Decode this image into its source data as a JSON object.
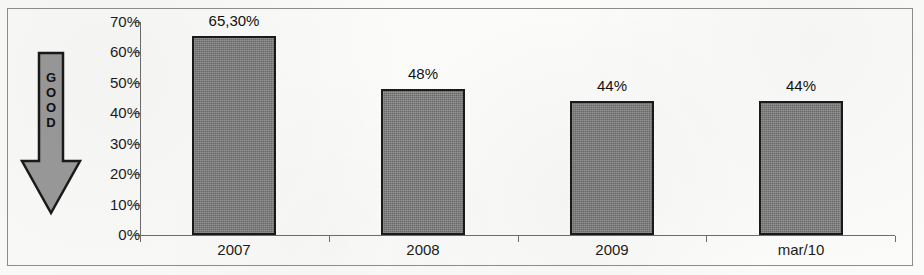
{
  "figure": {
    "annotation": {
      "name": "good-direction-arrow",
      "label": "GOOD",
      "letters": [
        "G",
        "O",
        "O",
        "D"
      ],
      "direction": "down",
      "fill_color": "#9a9a9a",
      "outline_color": "#1a1a1a"
    },
    "frame": {
      "border_color": "#8e8e8e"
    },
    "background_color": "#fbfbfa"
  },
  "chart_data": {
    "type": "bar",
    "title": "",
    "xlabel": "",
    "ylabel": "",
    "categories": [
      "2007",
      "2008",
      "2009",
      "mar/10"
    ],
    "values": [
      65.3,
      48,
      44,
      44
    ],
    "value_labels": [
      "65,30%",
      "48%",
      "44%",
      "44%"
    ],
    "ylim": [
      0,
      70
    ],
    "ytick_values": [
      0,
      10,
      20,
      30,
      40,
      50,
      60,
      70
    ],
    "ytick_labels": [
      "0%",
      "10%",
      "20%",
      "30%",
      "40%",
      "50%",
      "60%",
      "70%"
    ],
    "grid": false,
    "legend": null,
    "series": [
      {
        "name": "",
        "values": [
          65.3,
          48,
          44,
          44
        ],
        "bar_fill_color": "#7d7d7d",
        "bar_edge_color": "#1a1a1a"
      }
    ],
    "axis_color": "#6d6d6d",
    "text_color": "#1b1b1b"
  }
}
